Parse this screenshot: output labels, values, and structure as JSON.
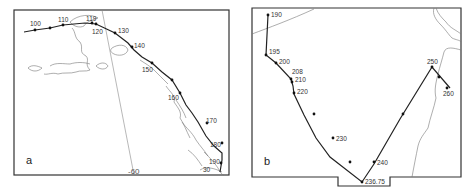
{
  "figure": {
    "panels": [
      {
        "id": "a",
        "letter": "a",
        "grid_label": "-60",
        "grid_label_small": "30",
        "track_points": [
          {
            "label": "100"
          },
          {
            "label": "110"
          },
          {
            "label": "119"
          },
          {
            "label": "120"
          },
          {
            "label": "130"
          },
          {
            "label": "140"
          },
          {
            "label": "150"
          },
          {
            "label": "160"
          },
          {
            "label": "170"
          },
          {
            "label": "180"
          },
          {
            "label": "190"
          }
        ]
      },
      {
        "id": "b",
        "letter": "b",
        "track_points": [
          {
            "label": "190"
          },
          {
            "label": "195"
          },
          {
            "label": "200"
          },
          {
            "label": "208"
          },
          {
            "label": "210"
          },
          {
            "label": "220"
          },
          {
            "label": "230"
          },
          {
            "label": "236.75"
          },
          {
            "label": "240"
          },
          {
            "label": "250"
          },
          {
            "label": "260"
          }
        ]
      }
    ]
  }
}
